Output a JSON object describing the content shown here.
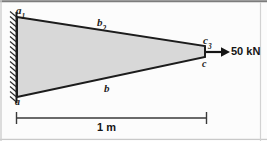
{
  "figure": {
    "kind": "engineering-diagram",
    "width": 267,
    "height": 141,
    "colors": {
      "background": "#fcfcfc",
      "beam_fill": "#d8d8d8",
      "outline": "#1c1c1c",
      "hatch": "#2a2a2a",
      "dimension": "#3a3a3a",
      "text": "#151515",
      "border": "#6e6e6e"
    }
  },
  "beam": {
    "name": "tapered-cantilever-beam",
    "root_top": {
      "x": 17,
      "y": 17
    },
    "root_bottom": {
      "x": 17,
      "y": 97
    },
    "tip_top": {
      "x": 205,
      "y": 46
    },
    "tip_bottom": {
      "x": 205,
      "y": 57
    }
  },
  "support": {
    "name": "fixed-wall-support",
    "type": "fixed",
    "x": 10,
    "y_top": 12,
    "y_bottom": 103,
    "thickness": 7,
    "hatch_count": 17
  },
  "nodes": {
    "a1": {
      "label": "a",
      "subscript": "1",
      "position": "top-left"
    },
    "a": {
      "label": "a",
      "subscript": "",
      "position": "bottom-left"
    },
    "c3": {
      "label": "c",
      "subscript": "3",
      "position": "tip-top"
    },
    "c": {
      "label": "c",
      "subscript": "",
      "position": "tip-bottom"
    }
  },
  "edges": {
    "b2": {
      "label": "b",
      "subscript": "2",
      "position": "top-edge"
    },
    "b": {
      "label": "b",
      "subscript": "",
      "position": "bottom-edge"
    }
  },
  "load": {
    "name": "applied-force",
    "label": "50 kN",
    "magnitude": 50,
    "unit": "kN",
    "direction": "right",
    "arrow_start_x": 210,
    "arrow_end_x": 229,
    "arrow_y": 52
  },
  "dimension": {
    "name": "span-dimension",
    "label": "1 m",
    "value": 1,
    "unit": "m",
    "x_start": 16,
    "x_end": 207,
    "y": 118,
    "tick_half_height": 6
  }
}
